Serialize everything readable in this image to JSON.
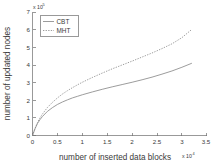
{
  "chart_data": {
    "type": "line",
    "title": "",
    "xlabel": "number of inserted data blocks",
    "ylabel": "number of updated nodes",
    "x_multiplier": "x 10",
    "x_multiplier_exp": "4",
    "y_multiplier": "x 10",
    "y_multiplier_exp": "5",
    "xlim": [
      0,
      3.5
    ],
    "ylim": [
      0,
      7
    ],
    "xticks": [
      "0",
      "0.5",
      "1",
      "1.5",
      "2",
      "2.5",
      "3",
      "3.5"
    ],
    "xtick_values": [
      0,
      0.5,
      1,
      1.5,
      2,
      2.5,
      3,
      3.5
    ],
    "yticks": [
      "0",
      "1",
      "2",
      "3",
      "4",
      "5",
      "6",
      "7"
    ],
    "ytick_values": [
      0,
      1,
      2,
      3,
      4,
      5,
      6,
      7
    ],
    "grid": false,
    "legend_position": "upper-left",
    "series": [
      {
        "name": "CBT",
        "style": "solid",
        "color": "#8a8a8a",
        "x": [
          0,
          0.05,
          0.1,
          0.15,
          0.2,
          0.3,
          0.4,
          0.5,
          0.6,
          0.7,
          0.8,
          0.9,
          1.0,
          1.2,
          1.4,
          1.6,
          1.8,
          2.0,
          2.2,
          2.4,
          2.6,
          2.8,
          3.0,
          3.2
        ],
        "values": [
          0,
          0.38,
          0.68,
          0.9,
          1.08,
          1.37,
          1.58,
          1.76,
          1.9,
          2.02,
          2.13,
          2.22,
          2.31,
          2.47,
          2.62,
          2.76,
          2.89,
          3.02,
          3.16,
          3.31,
          3.48,
          3.66,
          3.87,
          4.1
        ]
      },
      {
        "name": "MHT",
        "style": "dotted",
        "color": "#8a8a8a",
        "x": [
          0,
          0.05,
          0.1,
          0.15,
          0.2,
          0.3,
          0.4,
          0.5,
          0.6,
          0.7,
          0.8,
          0.9,
          1.0,
          1.2,
          1.4,
          1.6,
          1.8,
          2.0,
          2.2,
          2.4,
          2.6,
          2.8,
          3.0,
          3.2
        ],
        "values": [
          0,
          0.4,
          0.73,
          1.0,
          1.22,
          1.59,
          1.88,
          2.13,
          2.35,
          2.54,
          2.71,
          2.87,
          3.02,
          3.29,
          3.54,
          3.78,
          4.0,
          4.22,
          4.45,
          4.68,
          4.93,
          5.2,
          5.55,
          6.02
        ]
      }
    ]
  },
  "legend": {
    "items": [
      {
        "label": "CBT"
      },
      {
        "label": "MHT"
      }
    ]
  }
}
